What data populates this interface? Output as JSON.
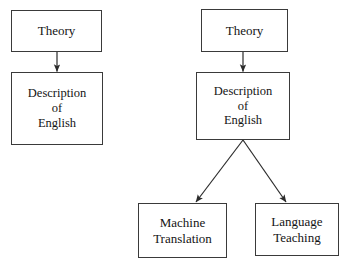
{
  "diagram": {
    "type": "flowchart",
    "background_color": "#ffffff",
    "line_color": "#3a3a3a",
    "text_color": "#141414",
    "columns": [
      {
        "name": "left-column",
        "nodes": [
          {
            "id": "theory-left",
            "label": "Theory"
          },
          {
            "id": "description-left",
            "label": "Description\nof\nEnglish"
          }
        ],
        "edges": [
          {
            "from": "theory-left",
            "to": "description-left",
            "style": "vertical-arrow"
          }
        ]
      },
      {
        "name": "right-column",
        "nodes": [
          {
            "id": "theory-right",
            "label": "Theory"
          },
          {
            "id": "description-right",
            "label": "Description\nof\nEnglish"
          },
          {
            "id": "machine-translation",
            "label": "Machine\nTranslation"
          },
          {
            "id": "language-teaching",
            "label": "Language\nTeaching"
          }
        ],
        "edges": [
          {
            "from": "theory-right",
            "to": "description-right",
            "style": "vertical-arrow"
          },
          {
            "from": "description-right",
            "to": "machine-translation",
            "style": "diagonal-arrow-left"
          },
          {
            "from": "description-right",
            "to": "language-teaching",
            "style": "diagonal-arrow-right"
          }
        ]
      }
    ]
  }
}
